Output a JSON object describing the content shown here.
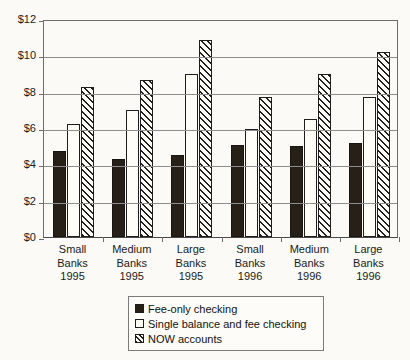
{
  "chart_data": {
    "type": "bar",
    "title": "",
    "subtitle": "",
    "xlabel": "",
    "ylabel": "",
    "ylim": [
      0,
      12
    ],
    "ytick_labels": [
      "$0",
      "$2",
      "$4",
      "$6",
      "$8",
      "$10",
      "$12"
    ],
    "ytick_values": [
      0,
      2,
      4,
      6,
      8,
      10,
      12
    ],
    "grid": true,
    "legend_position": "bottom",
    "categories": [
      "Small Banks 1995",
      "Medium Banks 1995",
      "Large Banks 1995",
      "Small Banks 1996",
      "Medium Banks 1996",
      "Large Banks 1996"
    ],
    "category_lines": [
      [
        "Small",
        "Banks",
        "1995"
      ],
      [
        "Medium",
        "Banks",
        "1995"
      ],
      [
        "Large",
        "Banks",
        "1995"
      ],
      [
        "Small",
        "Banks",
        "1996"
      ],
      [
        "Medium",
        "Banks",
        "1996"
      ],
      [
        "Large",
        "Banks",
        "1996"
      ]
    ],
    "series": [
      {
        "name": "Fee-only checking",
        "pattern": "solid-black",
        "color": "#262018",
        "values": [
          4.75,
          4.3,
          4.5,
          5.05,
          5.0,
          5.2
        ]
      },
      {
        "name": "Single balance and fee checking",
        "pattern": "open-white",
        "color": "#fffdf7",
        "values": [
          6.2,
          7.0,
          9.0,
          5.95,
          6.5,
          7.7
        ]
      },
      {
        "name": "NOW accounts",
        "pattern": "diagonal-hatch",
        "color": "#fffdf7",
        "values": [
          8.25,
          8.65,
          10.85,
          7.7,
          9.0,
          10.2
        ]
      }
    ]
  },
  "legend": {
    "items": [
      {
        "label": "Fee-only checking",
        "swatch": "solid"
      },
      {
        "label": "Single balance and fee checking",
        "swatch": "open"
      },
      {
        "label": "NOW accounts",
        "swatch": "hatch"
      }
    ]
  }
}
